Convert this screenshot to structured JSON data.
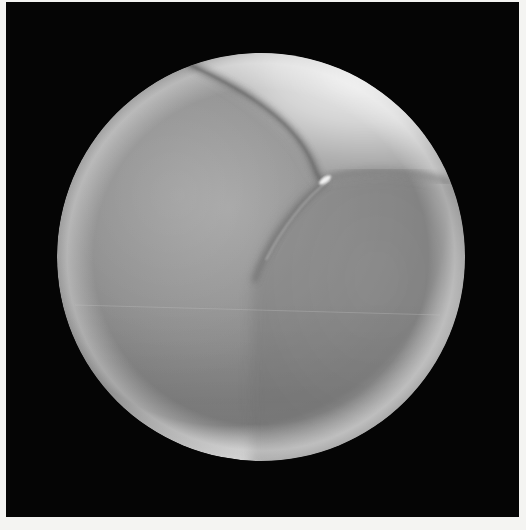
{
  "image": {
    "kind": "grayscale micrograph-style photograph",
    "subject": "sphere with cleavage furrows",
    "background_color": "#050505",
    "page_color": "#f4f4f2",
    "sphere": {
      "center": [
        261,
        257
      ],
      "radius": 204,
      "base_tone": "#8e8e8e",
      "highlight_region_tone": "#e2e2e2",
      "rim_tone": "#d4d4d4"
    },
    "features": [
      {
        "name": "upper-furrow",
        "description": "curved groove from top edge down to junction"
      },
      {
        "name": "right-furrow",
        "description": "groove from junction running right to sphere edge"
      },
      {
        "name": "lower-furrow",
        "description": "groove curving from junction down-left toward center"
      },
      {
        "name": "junction-highlight",
        "description": "bright specular spot at furrow junction"
      }
    ]
  }
}
